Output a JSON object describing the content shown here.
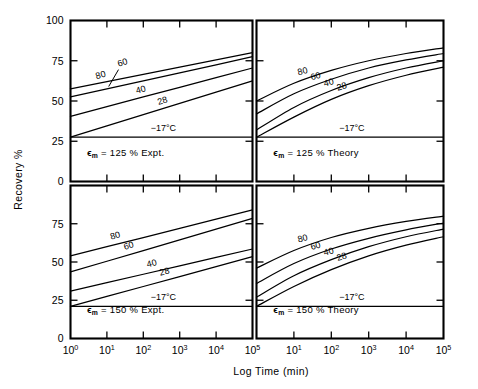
{
  "figure": {
    "axes": {
      "y_label": "Recovery %",
      "y_ticks": [
        "100",
        "75",
        "50",
        "25",
        "0"
      ],
      "y_min": 0,
      "y_max": 100,
      "x_label": "Log Time (min)",
      "x_tick_mantissa": "10",
      "x_tick_exponents": [
        "0",
        "1",
        "2",
        "3",
        "4",
        "5"
      ],
      "x_min_decade": 0,
      "x_max_decade": 5
    },
    "panels": [
      {
        "id": "top-left",
        "note_prefix": "ϵ",
        "note_sub": "m",
        "note_text": "= 125 %  Expt.",
        "temperature_label": "−17°C",
        "flat_value": 27.5,
        "curve_labels": [
          "80",
          "60",
          "40",
          "28"
        ]
      },
      {
        "id": "top-right",
        "note_prefix": "ϵ",
        "note_sub": "m",
        "note_text": "= 125 %  Theory",
        "temperature_label": "−17°C",
        "flat_value": 27.5,
        "curve_labels": [
          "80",
          "60",
          "40",
          "28"
        ]
      },
      {
        "id": "bottom-left",
        "note_prefix": "ϵ",
        "note_sub": "m",
        "note_text": "= 150 %  Expt.",
        "temperature_label": "−17°C",
        "flat_value": 21.0,
        "curve_labels": [
          "80",
          "60",
          "40",
          "28"
        ]
      },
      {
        "id": "bottom-right",
        "note_prefix": "ϵ",
        "note_sub": "m",
        "note_text": "= 150 %  Theory",
        "temperature_label": "−17°C",
        "flat_value": 21.0,
        "curve_labels": [
          "80",
          "60",
          "40",
          "28"
        ]
      }
    ]
  },
  "chart_data": {
    "type": "line",
    "title": "",
    "xlabel": "Log Time (min)",
    "ylabel": "Recovery %",
    "xscale": "log",
    "xlim": [
      1,
      100000
    ],
    "ylim": [
      0,
      100
    ],
    "x_tick_labels": [
      "10^0",
      "10^1",
      "10^2",
      "10^3",
      "10^4",
      "10^5"
    ],
    "y_tick_labels": [
      "0",
      "25",
      "50",
      "75",
      "100"
    ],
    "grid": false,
    "legend": "inline curve labels",
    "x_decades": [
      0,
      1,
      2,
      3,
      4,
      5
    ],
    "panels": [
      {
        "name": "ϵm = 125 % Expt.",
        "row": 0,
        "col": 0,
        "curve_style": "straight",
        "series": [
          {
            "name": "80",
            "values": [
              57.5,
              62.0,
              66.5,
              71.0,
              75.5,
              80.0
            ]
          },
          {
            "name": "60",
            "values": [
              52.5,
              57.5,
              62.5,
              67.5,
              72.5,
              77.5
            ]
          },
          {
            "name": "40",
            "values": [
              40.5,
              46.5,
              52.5,
              58.5,
              64.5,
              70.5
            ]
          },
          {
            "name": "28",
            "values": [
              27.5,
              34.5,
              41.5,
              48.5,
              55.5,
              62.5
            ]
          },
          {
            "name": "−17°C",
            "values": [
              27.5,
              27.5,
              27.5,
              27.5,
              27.5,
              27.5
            ]
          }
        ]
      },
      {
        "name": "ϵm = 125 % Theory",
        "row": 0,
        "col": 1,
        "curve_style": "curved",
        "series": [
          {
            "name": "80",
            "values": [
              50.0,
              61.0,
              69.0,
              75.0,
              79.5,
              83.0
            ]
          },
          {
            "name": "60",
            "values": [
              42.0,
              54.5,
              63.5,
              70.5,
              75.5,
              79.5
            ]
          },
          {
            "name": "40",
            "values": [
              32.0,
              46.0,
              56.5,
              64.5,
              70.5,
              75.0
            ]
          },
          {
            "name": "28",
            "values": [
              27.5,
              40.0,
              51.0,
              59.5,
              66.0,
              71.0
            ]
          },
          {
            "name": "−17°C",
            "values": [
              27.5,
              27.5,
              27.5,
              27.5,
              27.5,
              27.5
            ]
          }
        ]
      },
      {
        "name": "ϵm = 150 % Expt.",
        "row": 1,
        "col": 0,
        "curve_style": "straight",
        "series": [
          {
            "name": "80",
            "values": [
              54.0,
              60.0,
              66.0,
              72.0,
              78.0,
              84.0
            ]
          },
          {
            "name": "60",
            "values": [
              43.5,
              50.5,
              57.5,
              64.5,
              71.5,
              78.5
            ]
          },
          {
            "name": "40",
            "values": [
              31.0,
              36.5,
              42.0,
              47.5,
              53.0,
              58.5
            ]
          },
          {
            "name": "28",
            "values": [
              21.0,
              27.5,
              34.0,
              40.5,
              47.0,
              53.5
            ]
          },
          {
            "name": "−17°C",
            "values": [
              21.0,
              21.0,
              21.0,
              21.0,
              21.0,
              21.0
            ]
          }
        ]
      },
      {
        "name": "ϵm = 150 % Theory",
        "row": 1,
        "col": 1,
        "curve_style": "curved",
        "series": [
          {
            "name": "80",
            "values": [
              46.0,
              57.5,
              66.0,
              72.0,
              76.5,
              80.0
            ]
          },
          {
            "name": "60",
            "values": [
              36.0,
              49.0,
              58.5,
              65.5,
              71.0,
              75.5
            ]
          },
          {
            "name": "40",
            "values": [
              27.0,
              41.0,
              51.5,
              60.0,
              66.5,
              71.5
            ]
          },
          {
            "name": "28",
            "values": [
              21.0,
              34.0,
              45.0,
              54.0,
              61.0,
              66.5
            ]
          },
          {
            "name": "−17°C",
            "values": [
              21.0,
              21.0,
              21.0,
              21.0,
              21.0,
              21.0
            ]
          }
        ]
      }
    ]
  }
}
